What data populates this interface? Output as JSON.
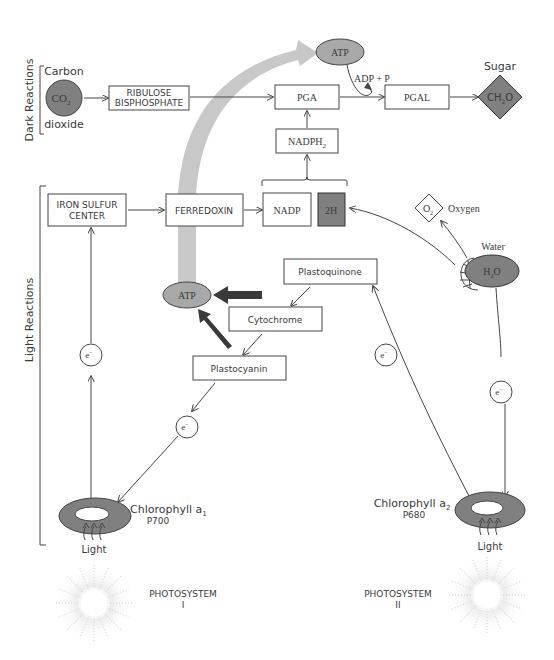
{
  "sections": {
    "dark_reactions": "Dark Reactions",
    "light_reactions": "Light Reactions"
  },
  "dark": {
    "co2_label_top": "Carbon",
    "co2_label_bottom": "dioxide",
    "co2": "CO",
    "co2_sub": "2",
    "ribulose_line1": "RIBULOSE",
    "ribulose_line2": "BISPHOSPHATE",
    "pga": "PGA",
    "pgal": "PGAL",
    "atp_top": "ATP",
    "adp_p": "ADP + P",
    "sugar_label": "Sugar",
    "sugar_c": "C",
    "sugar_h": "H",
    "sugar_sub": "2",
    "sugar_o": "O",
    "nadph2": "NADPH",
    "nadph2_sub": "2"
  },
  "light": {
    "iron_sulfur_line1": "IRON SULFUR",
    "iron_sulfur_line2": "CENTER",
    "ferredoxin": "FERREDOXIN",
    "nadp": "NADP",
    "two_h": "2H",
    "o2": "O",
    "o2_sub": "2",
    "oxygen_label": "Oxygen",
    "water_label": "Water",
    "h2o": "H",
    "h2o_sub": "2",
    "h2o_o": "O",
    "plastoquinone": "Plastoquinone",
    "cytochrome": "Cytochrome",
    "plastocyanin": "Plastocyanin",
    "atp_mid": "ATP",
    "electron": "e",
    "electron_sup": "−",
    "chlorophyll_a1": "Chlorophyll a",
    "chlorophyll_a1_sub": "1",
    "p700": "P700",
    "chlorophyll_a2": "Chlorophyll a",
    "chlorophyll_a2_sub": "2",
    "p680": "P680",
    "light_1": "Light",
    "light_2": "Light"
  },
  "photosystems": {
    "ps1_line1": "PHOTOSYSTEM",
    "ps1_line2": "I",
    "ps2_line1": "PHOTOSYSTEM",
    "ps2_line2": "II"
  },
  "colors": {
    "dark_fill": "#808080",
    "medium_fill": "#a8a8a8",
    "arc_fill": "#c8c8c8",
    "dark_arrow": "#3a3a3a",
    "stroke": "#444444"
  }
}
